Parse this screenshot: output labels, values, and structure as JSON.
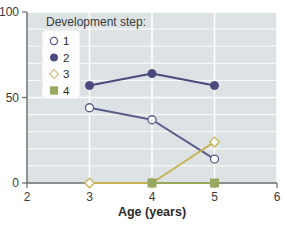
{
  "chart_data": {
    "type": "line",
    "title": "",
    "subtitle": "",
    "xlabel": "Age (years)",
    "ylabel": "",
    "x": [
      3,
      4,
      5
    ],
    "xlim": [
      2,
      6
    ],
    "ylim": [
      0,
      100
    ],
    "xticks": [
      "2",
      "3",
      "4",
      "5",
      "6"
    ],
    "xtick_values": [
      2,
      3,
      4,
      5,
      6
    ],
    "yticks": [
      "0",
      "50",
      "100"
    ],
    "ytick_values": [
      0,
      50,
      100
    ],
    "grid": "white gridlines on light blue-gray panel; vertical majors at each x tick, horizontal minors every 10 units",
    "legend": {
      "title": "Development step:",
      "position": "upper-left-inside",
      "entries": [
        {
          "label": "1",
          "marker": "open-circle",
          "color": "#5b5b8a"
        },
        {
          "label": "2",
          "marker": "filled-circle",
          "color": "#4a4a7d"
        },
        {
          "label": "3",
          "marker": "open-diamond",
          "color": "#d5c089"
        },
        {
          "label": "4",
          "marker": "filled-square",
          "color": "#97a860"
        }
      ]
    },
    "series": [
      {
        "name": "1",
        "marker": "open-circle",
        "color": "#5b5b8a",
        "x": [
          3,
          4,
          5
        ],
        "values": [
          44,
          37,
          14
        ]
      },
      {
        "name": "2",
        "marker": "filled-circle",
        "color": "#4a4a7d",
        "x": [
          3,
          4,
          5
        ],
        "values": [
          57,
          64,
          57
        ]
      },
      {
        "name": "3",
        "marker": "open-diamond",
        "color": "#c9b458",
        "x": [
          3,
          4,
          5
        ],
        "values": [
          0,
          0,
          24
        ]
      },
      {
        "name": "4",
        "marker": "filled-square",
        "color": "#97a860",
        "x": [
          4,
          5
        ],
        "values": [
          0,
          0
        ]
      }
    ],
    "colors": {
      "panel_background": "#dde3e4",
      "gridline": "#ffffff",
      "axis_line": "#6a6a6a",
      "page_background": "#ffffff",
      "series_1": "#5b5b8a",
      "series_2": "#4a4a7d",
      "series_3": "#c9b458",
      "series_4": "#97a860"
    }
  }
}
